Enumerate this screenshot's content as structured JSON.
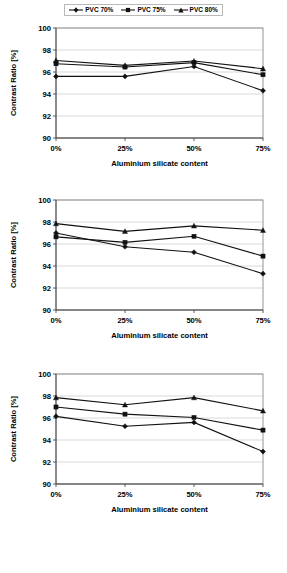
{
  "legend": {
    "items": [
      {
        "label": "PVC 70%",
        "marker": "diamond-marker-icon"
      },
      {
        "label": "PVC 75%",
        "marker": "square-marker-icon"
      },
      {
        "label": "PVC 80%",
        "marker": "triangle-marker-icon"
      }
    ]
  },
  "axes": {
    "ylabel": "Contrast Ratio [%]",
    "xlabel": "Aluminium silicate content",
    "yticks": [
      "100",
      "98",
      "96",
      "94",
      "92",
      "90"
    ],
    "xticks": [
      "0%",
      "25%",
      "50%",
      "75%"
    ]
  },
  "chart_data": [
    {
      "type": "line",
      "title": "",
      "xlabel": "Aluminium silicate content",
      "ylabel": "Contrast Ratio [%]",
      "categories": [
        "0%",
        "25%",
        "50%",
        "75%"
      ],
      "ylim": [
        90,
        100
      ],
      "ytick_step": 2,
      "grid": true,
      "legend_position": "top-center-shared",
      "series": [
        {
          "name": "PVC 70%",
          "marker": "diamond",
          "values": [
            95.6,
            95.6,
            96.5,
            94.3
          ]
        },
        {
          "name": "PVC 75%",
          "marker": "square",
          "values": [
            96.75,
            96.45,
            96.85,
            95.75
          ]
        },
        {
          "name": "PVC 80%",
          "marker": "triangle",
          "values": [
            97.05,
            96.6,
            97.0,
            96.3
          ]
        }
      ]
    },
    {
      "type": "line",
      "title": "",
      "xlabel": "Aluminium silicate content",
      "ylabel": "Contrast Ratio [%]",
      "categories": [
        "0%",
        "25%",
        "50%",
        "75%"
      ],
      "ylim": [
        90,
        100
      ],
      "ytick_step": 2,
      "grid": true,
      "legend_position": "top-center-shared",
      "series": [
        {
          "name": "PVC 70%",
          "marker": "diamond",
          "values": [
            97.0,
            95.75,
            95.25,
            93.3
          ]
        },
        {
          "name": "PVC 75%",
          "marker": "square",
          "values": [
            96.65,
            96.15,
            96.7,
            94.9
          ]
        },
        {
          "name": "PVC 80%",
          "marker": "triangle",
          "values": [
            97.85,
            97.15,
            97.65,
            97.25
          ]
        }
      ]
    },
    {
      "type": "line",
      "title": "",
      "xlabel": "Aluminium silicate content",
      "ylabel": "Contrast Ratio [%]",
      "categories": [
        "0%",
        "25%",
        "50%",
        "75%"
      ],
      "ylim": [
        90,
        100
      ],
      "ytick_step": 2,
      "grid": true,
      "legend_position": "top-center-shared",
      "series": [
        {
          "name": "PVC 70%",
          "marker": "diamond",
          "values": [
            96.15,
            95.25,
            95.6,
            92.95
          ]
        },
        {
          "name": "PVC 75%",
          "marker": "square",
          "values": [
            97.0,
            96.35,
            96.05,
            94.9
          ]
        },
        {
          "name": "PVC 80%",
          "marker": "triangle",
          "values": [
            97.85,
            97.2,
            97.85,
            96.65
          ]
        }
      ]
    }
  ]
}
